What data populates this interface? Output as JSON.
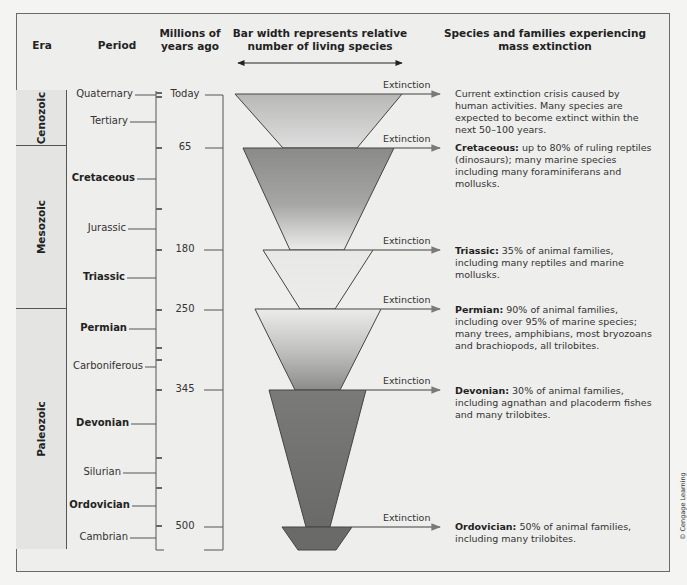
{
  "headers": {
    "era": "Era",
    "period": "Period",
    "mya_line1": "Millions of",
    "mya_line2": "years ago",
    "bar_line1": "Bar width represents relative",
    "bar_line2": "number of living species",
    "species_line1": "Species and families experiencing",
    "species_line2": "mass extinction"
  },
  "eras": [
    {
      "name": "Cenozoic"
    },
    {
      "name": "Mesozoic"
    },
    {
      "name": "Paleozoic"
    }
  ],
  "periods": [
    {
      "name": "Quaternary",
      "bold": false
    },
    {
      "name": "Tertiary",
      "bold": false
    },
    {
      "name": "Cretaceous",
      "bold": true
    },
    {
      "name": "Jurassic",
      "bold": false
    },
    {
      "name": "Triassic",
      "bold": true
    },
    {
      "name": "Permian",
      "bold": true
    },
    {
      "name": "Carboniferous",
      "bold": false
    },
    {
      "name": "Devonian",
      "bold": true
    },
    {
      "name": "Silurian",
      "bold": false
    },
    {
      "name": "Ordovician",
      "bold": true
    },
    {
      "name": "Cambrian",
      "bold": false
    }
  ],
  "time_marks": [
    {
      "label": "Today"
    },
    {
      "label": "65"
    },
    {
      "label": "180"
    },
    {
      "label": "250"
    },
    {
      "label": "345"
    },
    {
      "label": "500"
    }
  ],
  "extinctions": [
    {
      "label": "Extinction",
      "period": "",
      "text": "Current extinction crisis caused by human activities. Many species are expected to become extinct within the next 50–100 years."
    },
    {
      "label": "Extinction",
      "period": "Cretaceous:",
      "text": " up to 80% of ruling reptiles (dinosaurs); many marine species including many foraminiferans and mollusks."
    },
    {
      "label": "Extinction",
      "period": "Triassic:",
      "text": " 35% of animal families, including many reptiles and marine mollusks."
    },
    {
      "label": "Extinction",
      "period": "Permian:",
      "text": " 90% of animal families, including over 95% of marine species; many trees, amphibians, most bryozoans and brachiopods, all trilobites."
    },
    {
      "label": "Extinction",
      "period": "Devonian:",
      "text": " 30% of animal families, including agnathan and placoderm fishes and many trilobites."
    },
    {
      "label": "Extinction",
      "period": "Ordovician:",
      "text": " 50% of animal families, including many trilobites."
    }
  ],
  "credit": "© Cengage Learning",
  "colors": {
    "funnel_light": "#e2e2e0",
    "funnel_mid": "#a8a8a6",
    "funnel_dark": "#6e6e6c",
    "line": "#555555",
    "arrow": "#7a7a7a"
  }
}
